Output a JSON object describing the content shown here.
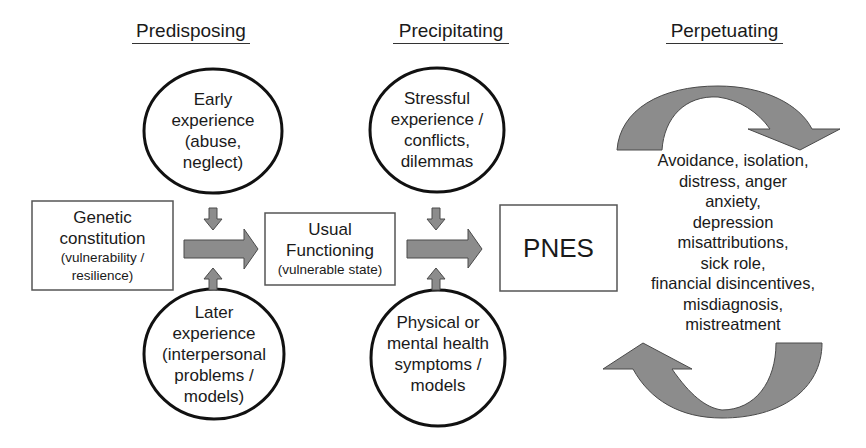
{
  "headings": {
    "predisposing": "Predisposing",
    "precipitating": "Precipitating",
    "perpetuating": "Perpetuating"
  },
  "ellipses": {
    "early": [
      "Early",
      "experience",
      "(abuse,",
      "neglect)"
    ],
    "later": [
      "Later",
      "experience",
      "(interpersonal",
      "problems /",
      "models)"
    ],
    "stressful": [
      "Stressful",
      "experience /",
      "conflicts,",
      "dilemmas"
    ],
    "physical": [
      "Physical or",
      "mental health",
      "symptoms /",
      "models"
    ]
  },
  "boxes": {
    "genetic": {
      "main": [
        "Genetic",
        "constitution"
      ],
      "sub": [
        "(vulnerability /",
        "resilience)"
      ]
    },
    "usual": {
      "main": [
        "Usual",
        "Functioning"
      ],
      "sub": [
        "(vulnerable state)"
      ]
    },
    "pnes": {
      "main": "PNES"
    }
  },
  "perpetuating_factors": [
    "Avoidance, isolation,",
    "distress, anger",
    "anxiety,",
    "depression",
    "misattributions,",
    "sick role,",
    "financial disincentives,",
    "misdiagnosis,",
    "mistreatment"
  ],
  "colors": {
    "arrow_fill": "#8c8c8c",
    "arrow_stroke": "#4a4a4a",
    "outline": "#111111",
    "box_stroke": "#555555"
  }
}
